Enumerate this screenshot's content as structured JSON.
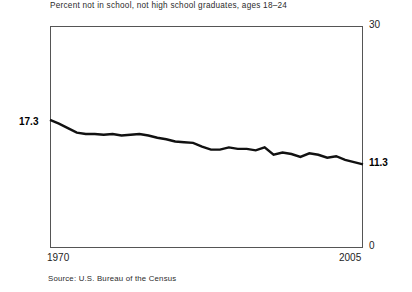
{
  "chart_data": {
    "type": "line",
    "title": "Percent not in school, not high school graduates, ages 18–24",
    "source": "Source: U.S. Bureau of the Census",
    "xlabel": "",
    "ylabel": "",
    "xlim": [
      1970,
      2005
    ],
    "ylim": [
      0,
      30
    ],
    "grid": false,
    "legend": false,
    "x_tick_labels": [
      "1970",
      "2005"
    ],
    "y_tick_labels": [
      "0",
      "30"
    ],
    "y_axis_side": "right",
    "annotations": [
      {
        "text": "17.3",
        "at_x": 1970,
        "at_y": 17.3,
        "position": "left-of-axis",
        "bold": true
      },
      {
        "text": "11.3",
        "at_x": 2005,
        "at_y": 11.3,
        "position": "right-of-axis",
        "bold": true
      }
    ],
    "series_name": "Percent not in school, not high school graduates, ages 18-24",
    "line_color": "#111111",
    "line_width": 2.4,
    "x": [
      1970,
      1971,
      1972,
      1973,
      1974,
      1975,
      1976,
      1977,
      1978,
      1979,
      1980,
      1981,
      1982,
      1983,
      1984,
      1985,
      1986,
      1987,
      1988,
      1989,
      1990,
      1991,
      1992,
      1993,
      1994,
      1995,
      1996,
      1997,
      1998,
      1999,
      2000,
      2001,
      2002,
      2003,
      2004,
      2005
    ],
    "values": [
      17.3,
      16.8,
      16.2,
      15.6,
      15.4,
      15.4,
      15.3,
      15.4,
      15.2,
      15.3,
      15.4,
      15.2,
      14.9,
      14.7,
      14.4,
      14.3,
      14.2,
      13.7,
      13.3,
      13.3,
      13.6,
      13.4,
      13.4,
      13.2,
      13.6,
      12.6,
      12.9,
      12.7,
      12.3,
      12.8,
      12.6,
      12.2,
      12.4,
      11.9,
      11.6,
      11.3
    ]
  }
}
